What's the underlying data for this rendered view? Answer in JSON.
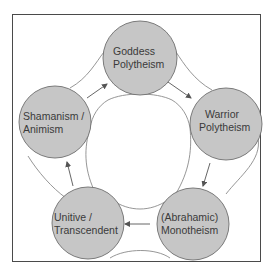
{
  "diagram": {
    "nodes": [
      {
        "id": "goddess",
        "line1": "Goddess",
        "line2": "Polytheism"
      },
      {
        "id": "warrior",
        "line1": "Warrior",
        "line2": "Polytheism"
      },
      {
        "id": "abrahamic",
        "line1": "(Abrahamic)",
        "line2": "Monotheism"
      },
      {
        "id": "unitive",
        "line1": "Unitive /",
        "line2": "Transcendent"
      },
      {
        "id": "shamanism",
        "line1": "Shamanism /",
        "line2": "Animism"
      }
    ],
    "edges": [
      {
        "from": "shamanism",
        "to": "goddess"
      },
      {
        "from": "goddess",
        "to": "warrior"
      },
      {
        "from": "warrior",
        "to": "abrahamic"
      },
      {
        "from": "abrahamic",
        "to": "unitive"
      },
      {
        "from": "unitive",
        "to": "shamanism"
      }
    ],
    "colors": {
      "node_fill": "#c6c6c6",
      "node_stroke": "#6e6e6e",
      "line": "#7a7a7a",
      "frame": "#4a4a4a"
    }
  }
}
